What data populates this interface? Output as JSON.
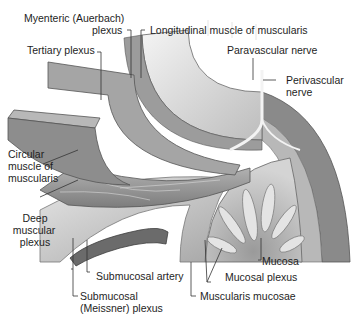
{
  "figure": {
    "colors": {
      "background": "#ffffff",
      "tissue_light": "#d9d9d9",
      "tissue_mid": "#a8a8a8",
      "tissue_dark": "#6e6e6e",
      "nerve": "#f2f2f2",
      "leader_line": "#333333"
    }
  },
  "labels": {
    "myenteric_line1": "Myenteric (Auerbach)",
    "myenteric_line2": "plexus",
    "longitudinal": "Longitudinal muscle of muscularis",
    "tertiary": "Tertiary plexus",
    "paravascular": "Paravascular nerve",
    "perivascular_line1": "Perivascular",
    "perivascular_line2": "nerve",
    "circular_line1": "Circular",
    "circular_line2": "muscle of",
    "circular_line3": "muscularis",
    "deep_line1": "Deep",
    "deep_line2": "muscular",
    "deep_line3": "plexus",
    "mucosa": "Mucosa",
    "mucosal_plexus": "Mucosal plexus",
    "submucosal_artery": "Submucosal artery",
    "muscularis_mucosae": "Muscularis mucosae",
    "submucosal_line1": "Submucosal",
    "submucosal_line2": "(Meissner) plexus"
  }
}
